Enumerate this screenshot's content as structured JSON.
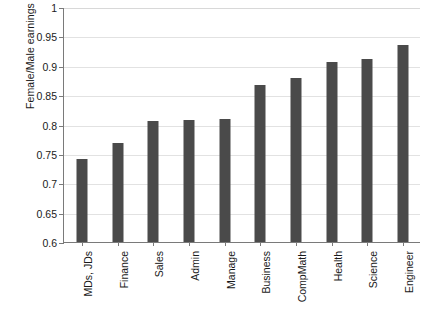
{
  "chart_data": {
    "type": "bar",
    "title": "",
    "xlabel": "",
    "ylabel": "Female/Male earnings",
    "ylim": [
      0.6,
      1
    ],
    "yticks": [
      0.6,
      0.65,
      0.7,
      0.75,
      0.8,
      0.85,
      0.9,
      0.95,
      1
    ],
    "ytick_labels": [
      "0.6",
      "0.65",
      "0.7",
      "0.75",
      "0.8",
      "0.85",
      "0.9",
      "0.95",
      "1"
    ],
    "grid": true,
    "legend": false,
    "bar_color": "#4a4a4a",
    "axis_color": "#7a7a7a",
    "grid_color": "#e2e2e2",
    "categories": [
      "MDs, JDs",
      "Finance",
      "Sales",
      "Admin",
      "Manage",
      "Business",
      "CompMath",
      "Health",
      "Science",
      "Engineer"
    ],
    "values": [
      0.741,
      0.769,
      0.806,
      0.808,
      0.81,
      0.868,
      0.879,
      0.906,
      0.911,
      0.935
    ]
  }
}
